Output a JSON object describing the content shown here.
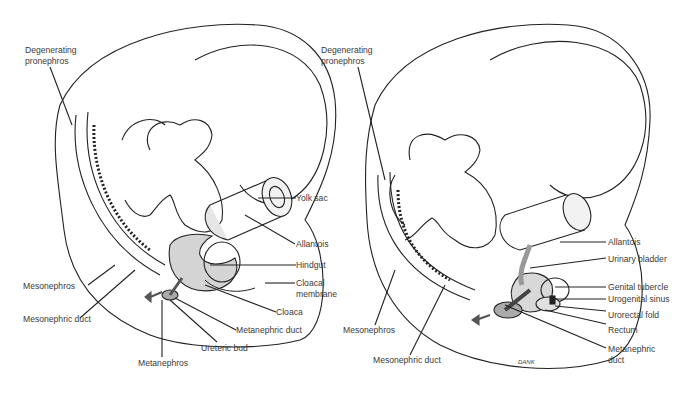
{
  "panels": [
    {
      "id": "left",
      "labels": [
        {
          "key": "degenerating_pronephros",
          "lines": [
            "Degenerating",
            "pronephros"
          ]
        },
        {
          "key": "yolk_sac",
          "lines": [
            "Yolk sac"
          ]
        },
        {
          "key": "allantois",
          "lines": [
            "Allantois"
          ]
        },
        {
          "key": "hindgut",
          "lines": [
            "Hindgut"
          ]
        },
        {
          "key": "cloacal_membrane",
          "lines": [
            "Cloacal",
            "membrane"
          ]
        },
        {
          "key": "cloaca",
          "lines": [
            "Cloaca"
          ]
        },
        {
          "key": "mesonephros",
          "lines": [
            "Mesonephros"
          ]
        },
        {
          "key": "mesonephric_duct",
          "lines": [
            "Mesonephric duct"
          ]
        },
        {
          "key": "metanephric_duct",
          "lines": [
            "Metanephric duct"
          ]
        },
        {
          "key": "ureteric_bud",
          "lines": [
            "Ureteric bud"
          ]
        },
        {
          "key": "metanephros",
          "lines": [
            "Metanephros"
          ]
        }
      ]
    },
    {
      "id": "right",
      "labels": [
        {
          "key": "degenerating_pronephros",
          "lines": [
            "Degenerating",
            "pronephros"
          ]
        },
        {
          "key": "allantois",
          "lines": [
            "Allantois"
          ]
        },
        {
          "key": "urinary_bladder",
          "lines": [
            "Urinary bladder"
          ]
        },
        {
          "key": "genital_tubercle",
          "lines": [
            "Genital tubercle"
          ]
        },
        {
          "key": "urogenital_sinus",
          "lines": [
            "Urogenital sinus"
          ]
        },
        {
          "key": "urorectal_fold",
          "lines": [
            "Urorectal fold"
          ]
        },
        {
          "key": "rectum",
          "lines": [
            "Rectum"
          ]
        },
        {
          "key": "metanephric_duct",
          "lines": [
            "Metanephric",
            "duct"
          ]
        },
        {
          "key": "mesonephros",
          "lines": [
            "Mesonephros"
          ]
        },
        {
          "key": "mesonephric_duct",
          "lines": [
            "Mesonephric duct"
          ]
        }
      ],
      "signature": "DANK"
    }
  ],
  "colors": {
    "line": "#222222",
    "shade": "#c8c8c8",
    "dark_shade": "#555555",
    "text": "#3a3a3a"
  }
}
